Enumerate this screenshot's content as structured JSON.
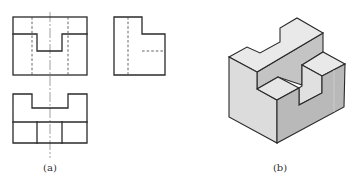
{
  "figure": {
    "type": "engineering-drawing",
    "subfigures": [
      {
        "id": "a",
        "label": "(a)",
        "description": "Three-view orthographic projection (front, side, top)",
        "views": [
          "front-view",
          "side-view",
          "top-view"
        ]
      },
      {
        "id": "b",
        "label": "(b)",
        "description": "Isometric view of the solid"
      }
    ]
  },
  "colors": {
    "line": "#2a2a2a",
    "hidden_line": "#555555",
    "center_line": "#777777",
    "face_top": "#e9e9e9",
    "face_left": "#dcdcdc",
    "face_right": "#b9b9b9",
    "face_inner": "#c4c4c4",
    "face_notch": "#e0e0e0"
  },
  "labels": {
    "a": "(a)",
    "b": "(b)"
  }
}
